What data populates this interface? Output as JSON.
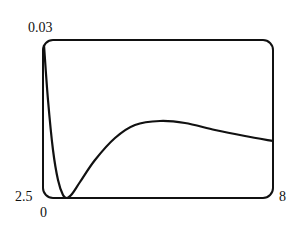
{
  "chart_data": {
    "type": "line",
    "title": "",
    "xlabel": "",
    "ylabel": "",
    "xlim": [
      0,
      8
    ],
    "ylim": [
      2.5,
      0.03
    ],
    "tick_labels": {
      "x_min": "0",
      "x_max": "8",
      "y_min": "2.5",
      "y_max": "0.03"
    },
    "grid": false,
    "legend": null,
    "series": [
      {
        "name": "curve",
        "points_px": [
          [
            44,
            45
          ],
          [
            48,
            100
          ],
          [
            53,
            150
          ],
          [
            58,
            180
          ],
          [
            63,
            195
          ],
          [
            67,
            198
          ],
          [
            72,
            194
          ],
          [
            80,
            182
          ],
          [
            95,
            160
          ],
          [
            115,
            138
          ],
          [
            135,
            125
          ],
          [
            160,
            121
          ],
          [
            185,
            123
          ],
          [
            215,
            130
          ],
          [
            245,
            136
          ],
          [
            273,
            141
          ]
        ]
      }
    ]
  }
}
